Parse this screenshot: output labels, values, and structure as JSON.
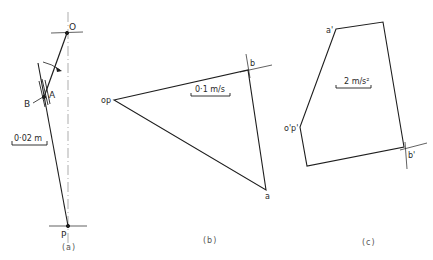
{
  "figure": {
    "panels": [
      {
        "id": "a",
        "caption": "(a)",
        "title": "Configuration diagram",
        "points": {
          "O": "O",
          "A": "A",
          "B": "B",
          "P": "P"
        },
        "scale_label": "0·02 m"
      },
      {
        "id": "b",
        "caption": "(b)",
        "title": "Velocity diagram",
        "points": {
          "op": "op",
          "a": "a",
          "b": "b"
        },
        "scale_label": "0·1 m/s"
      },
      {
        "id": "c",
        "caption": "(c)",
        "title": "Acceleration diagram",
        "points": {
          "op": "o'p'",
          "a": "a'",
          "b": "b'"
        },
        "scale_label": "2 m/s²"
      }
    ],
    "colors": {
      "line": "#1e1e1e",
      "background": "#ffffff",
      "caption": "#555555"
    }
  }
}
